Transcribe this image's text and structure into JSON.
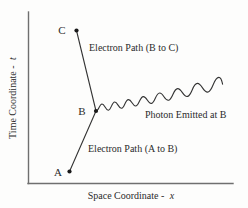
{
  "figure": {
    "background_color": "#fdfdfc",
    "ink_color": "#2b2b2b",
    "axes": {
      "y_axis_label": "Time Coordinate -",
      "y_axis_symbol": "t",
      "x_axis_label": "Space Coordinate -",
      "x_axis_symbol": "x",
      "origin": {
        "x": 28,
        "y": 183
      },
      "y_axis_top": {
        "x": 28,
        "y": 12
      },
      "x_axis_right": {
        "x": 233,
        "y": 183
      }
    },
    "points": [
      {
        "name": "A",
        "label": "A",
        "x": 69,
        "y": 172,
        "label_x": 58,
        "label_y": 176
      },
      {
        "name": "B",
        "label": "B",
        "x": 96,
        "y": 111,
        "label_x": 82,
        "label_y": 115
      },
      {
        "name": "C",
        "label": "C",
        "x": 76,
        "y": 30,
        "label_x": 62,
        "label_y": 34
      }
    ],
    "paths": [
      {
        "name": "electron-path-a-to-b",
        "label": "Electron Path (A to B)",
        "from": "A",
        "to": "B",
        "label_x": 88,
        "label_y": 152
      },
      {
        "name": "electron-path-b-to-c",
        "label": "Electron Path (B to C)",
        "from": "B",
        "to": "C",
        "label_x": 89,
        "label_y": 51
      },
      {
        "name": "photon-wave",
        "label": "Photon Emitted at B",
        "from": "B",
        "to_x": 222,
        "to_y": 73,
        "label_x": 145,
        "label_y": 118
      }
    ]
  }
}
